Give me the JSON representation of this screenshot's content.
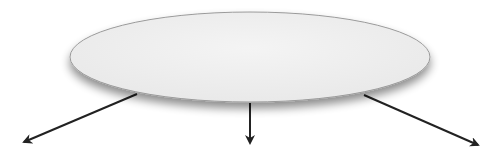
{
  "diagram": {
    "type": "branching",
    "central_node": {
      "shape": "ellipse",
      "label": "",
      "fill": "#efefef",
      "stroke": "#9a9a9a",
      "cx": 250,
      "cy": 57,
      "rx": 180,
      "ry": 45
    },
    "arrows": [
      {
        "id": "left",
        "x1": 137,
        "y1": 94,
        "x2": 24,
        "y2": 142
      },
      {
        "id": "center",
        "x1": 250,
        "y1": 103,
        "x2": 250,
        "y2": 143
      },
      {
        "id": "right",
        "x1": 364,
        "y1": 95,
        "x2": 478,
        "y2": 145
      }
    ],
    "arrow_color": "#222222"
  }
}
